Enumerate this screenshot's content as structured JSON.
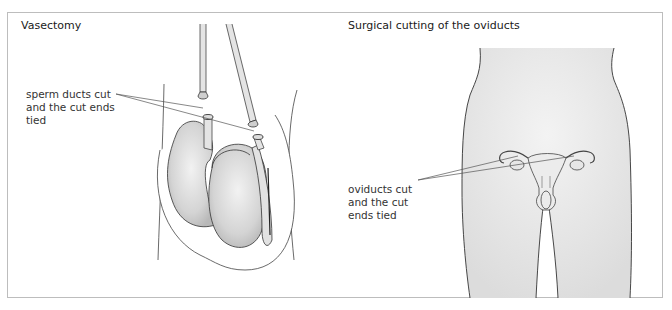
{
  "panels": [
    {
      "id": "vasectomy",
      "title": "Vasectomy",
      "callout_label": "sperm ducts cut\nand the cut ends\ntied",
      "callout_targets": 2
    },
    {
      "id": "tubal-ligation",
      "title": "Surgical cutting of the oviducts",
      "callout_label": "oviducts cut\nand the cut\nends tied",
      "callout_targets": 2
    }
  ],
  "colors": {
    "frame_border": "#bdbdbd",
    "body_fill": "#e6e6e6",
    "organ_fill": "#d9d9d9",
    "outline": "#333333",
    "leader_line": "#555555"
  }
}
